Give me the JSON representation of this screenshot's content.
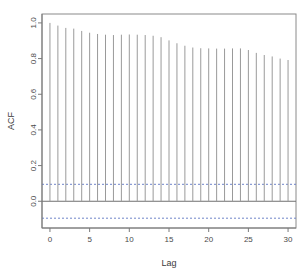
{
  "chart_data": {
    "type": "bar",
    "title": "",
    "subtitle": "",
    "xlabel": "Lag",
    "ylabel": "ACF",
    "xlim": [
      -1,
      31
    ],
    "ylim": [
      -0.15,
      1.05
    ],
    "grid": false,
    "legend": null,
    "x_ticks": [
      0,
      5,
      10,
      15,
      20,
      25,
      30
    ],
    "x_tick_labels": [
      "0",
      "5",
      "10",
      "15",
      "20",
      "25",
      "30"
    ],
    "y_ticks": [
      0.0,
      0.2,
      0.4,
      0.6,
      0.8,
      1.0
    ],
    "y_tick_labels": [
      "0.0",
      "0.2",
      "0.4",
      "0.6",
      "0.8",
      "1.0"
    ],
    "categories": [
      0,
      1,
      2,
      3,
      4,
      5,
      6,
      7,
      8,
      9,
      10,
      11,
      12,
      13,
      14,
      15,
      16,
      17,
      18,
      19,
      20,
      21,
      22,
      23,
      24,
      25,
      26,
      27,
      28,
      29,
      30
    ],
    "values": [
      1.0,
      0.985,
      0.972,
      0.968,
      0.955,
      0.945,
      0.938,
      0.934,
      0.932,
      0.934,
      0.935,
      0.934,
      0.932,
      0.928,
      0.92,
      0.902,
      0.886,
      0.872,
      0.862,
      0.858,
      0.857,
      0.856,
      0.856,
      0.857,
      0.857,
      0.848,
      0.832,
      0.82,
      0.812,
      0.8,
      0.792
    ],
    "series": [
      {
        "name": "ACF",
        "values": [
          1.0,
          0.985,
          0.972,
          0.968,
          0.955,
          0.945,
          0.938,
          0.934,
          0.932,
          0.934,
          0.935,
          0.934,
          0.932,
          0.928,
          0.92,
          0.902,
          0.886,
          0.872,
          0.862,
          0.858,
          0.857,
          0.856,
          0.856,
          0.857,
          0.857,
          0.848,
          0.832,
          0.82,
          0.812,
          0.8,
          0.792
        ]
      }
    ],
    "confidence_bands": {
      "upper": 0.095,
      "lower": -0.095,
      "style": "dashed",
      "color": "#6f84c9"
    },
    "zero_line": 0.0,
    "colors": {
      "bar": "#9a9a9a",
      "axis": "#7a7a7a",
      "frame": "#8a8a8a",
      "confidence": "#6f84c9",
      "text": "#4a4a4a"
    }
  }
}
